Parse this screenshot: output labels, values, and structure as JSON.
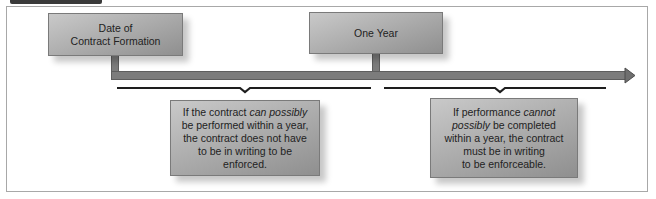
{
  "diagram": {
    "start_box": {
      "label": "Date of\nContract Formation"
    },
    "end_box": {
      "label": "One Year"
    },
    "left_result": {
      "line1_prefix": "If the contract ",
      "line1_emphasis": "can possibly",
      "rest": "be performed within a year,\nthe contract does not have\nto be in writing to be\nenforced."
    },
    "right_result": {
      "line1_prefix": "If performance ",
      "line1_emphasis": "cannot\npossibly",
      "rest": " be completed\nwithin a year, the contract\nmust be in writing\nto be enforceable."
    },
    "colors": {
      "box_fill_light": "#c9c9c9",
      "box_fill_dark": "#8f8f8f",
      "timeline_bar": "#7c7c7c",
      "brace": "#1e1e1e",
      "frame_border": "#a8a8a8"
    }
  }
}
